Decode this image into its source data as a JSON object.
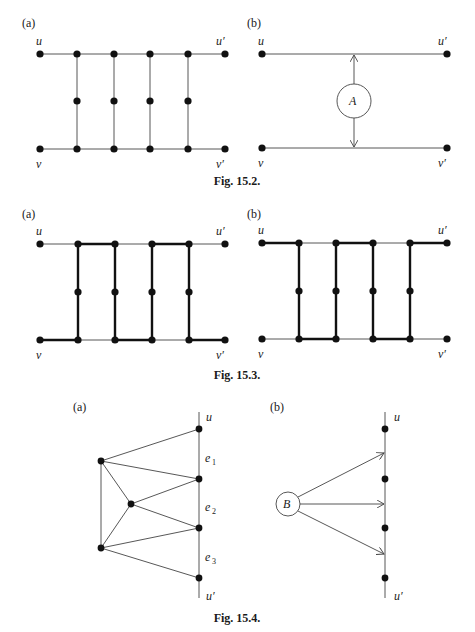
{
  "figures": [
    {
      "id": "fig-15-2",
      "caption": "Fig. 15.2.",
      "panels": [
        {
          "label": "(a)",
          "nodes": {
            "u": "u",
            "u_prime": "u′",
            "v": "v",
            "v_prime": "v′"
          }
        },
        {
          "label": "(b)",
          "nodes": {
            "u": "u",
            "u_prime": "u′",
            "v": "v",
            "v_prime": "v′"
          },
          "gadget": "A"
        }
      ]
    },
    {
      "id": "fig-15-3",
      "caption": "Fig. 15.3.",
      "panels": [
        {
          "label": "(a)",
          "nodes": {
            "u": "u",
            "u_prime": "u′",
            "v": "v",
            "v_prime": "v′"
          }
        },
        {
          "label": "(b)",
          "nodes": {
            "u": "u",
            "u_prime": "u′",
            "v": "v",
            "v_prime": "v′"
          }
        }
      ]
    },
    {
      "id": "fig-15-4",
      "caption": "Fig. 15.4.",
      "panels": [
        {
          "label": "(a)",
          "nodes": {
            "u": "u",
            "u_prime": "u′"
          },
          "edges": [
            "e1",
            "e2",
            "e3"
          ],
          "edge_labels": {
            "e": "e",
            "sub1": "1",
            "sub2": "2",
            "sub3": "3"
          }
        },
        {
          "label": "(b)",
          "nodes": {
            "u": "u",
            "u_prime": "u′"
          },
          "gadget": "B"
        }
      ]
    }
  ]
}
